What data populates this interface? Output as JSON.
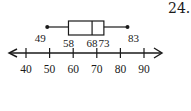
{
  "problem_number": "24.",
  "chart_data": {
    "type": "boxplot",
    "title": "",
    "xlabel": "",
    "ylabel": "",
    "five_number_summary": {
      "min": 49,
      "q1": 58,
      "median": 68,
      "q3": 73,
      "max": 83
    },
    "point_labels": [
      "49",
      "58",
      "68",
      "73",
      "83"
    ],
    "axis": {
      "range": [
        40,
        90
      ],
      "ticks": [
        40,
        50,
        60,
        70,
        80,
        90
      ],
      "tick_labels": [
        "40",
        "50",
        "60",
        "70",
        "80",
        "90"
      ],
      "arrows_both_ends": true
    },
    "grid": false,
    "legend": null
  },
  "colors": {
    "ink": "#1a1a1a",
    "background": "#ffffff"
  }
}
